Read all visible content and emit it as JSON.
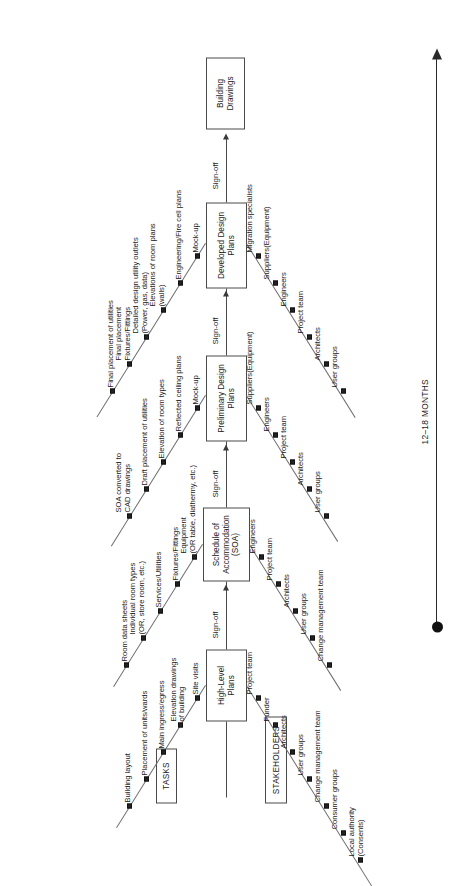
{
  "diagram": {
    "tasks_caption": "TASKS",
    "stakeholders_caption": "STAKEHOLDERS",
    "signoff_label": "Sign-off",
    "timeline_label": "12–18 MONTHS"
  },
  "stages": [
    {
      "id": "high-level-plans",
      "box_label": "High-Level\nPlans",
      "tasks": [
        "Building layout",
        "Placement of units/wards",
        "Main ingress/egress",
        "Elevation drawings\nof building",
        "Site visits"
      ],
      "stakeholders": [
        "Project team",
        "Funder",
        "Architects",
        "User groups",
        "Change management team",
        "Consumer groups",
        "Local authority\n(Consents)"
      ]
    },
    {
      "id": "schedule-of-accommodation",
      "box_label": "Schedule of\nAccommodation\n(SOA)",
      "tasks": [
        "Room data sheets",
        "Individual room types\n(OR, store room, etc.)",
        "Services/Utilities",
        "Fixtures/Fittings",
        "Equipment\n(OR table, diathermy, etc.)"
      ],
      "stakeholders": [
        "Engineers",
        "Project team",
        "Architects",
        "User groups",
        "Change management team"
      ]
    },
    {
      "id": "preliminary-design-plans",
      "box_label": "Preliminary Design\nPlans",
      "tasks": [
        "SOA converted to\nCAD drawings",
        "Draft placement of utilities",
        "Elevation of room types",
        "Reflected ceiling plans",
        "Mock-up"
      ],
      "stakeholders": [
        "Suppliers(Equipment)",
        "Engineers",
        "Project team",
        "Architects",
        "User groups"
      ]
    },
    {
      "id": "developed-design-plans",
      "box_label": "Developed Design\nPlans",
      "tasks": [
        "Final placement of utilities",
        "Final placement\nFixtures/Fittings",
        "Detailed design utility outlets\n(Power, gas, data)",
        "Elevations of room plans\n(walls)",
        "Engineering/Fire cell plans",
        "Mock-up"
      ],
      "stakeholders": [
        "Migration specialists",
        "Suppliers(Equipment)",
        "Engineers",
        "Project team",
        "Architects",
        "User groups"
      ]
    },
    {
      "id": "building-drawings",
      "box_label": "Building\nDrawings",
      "tasks": [],
      "stakeholders": []
    }
  ],
  "colors": {
    "line": "#4a4a4a",
    "branch": "#6e6e6e",
    "text": "#1a1a1a",
    "marker": "#222222"
  }
}
